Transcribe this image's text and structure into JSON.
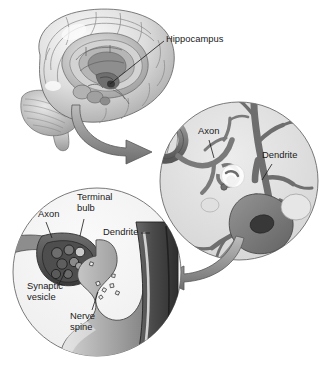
{
  "figure": {
    "background_color": "#ffffff"
  },
  "palette": {
    "ink": "#1a1a1a",
    "circle_fill_light": "#e3e3e3",
    "circle_fill_lighter": "#f2f2f2",
    "neuron_mid_gray": "#8d8d8d",
    "neuron_dark_gray": "#6f6f6f",
    "soma_gray": "#7d7d7d",
    "nucleus_dark": "#3f3f3f",
    "arrow_gray": "#9a9a9a",
    "arrow_dark_edge": "#5c5c5c",
    "brain_light": "#efefef",
    "brain_mid": "#c9c9c9",
    "brain_shadow": "#8f8f8f",
    "outline": "#555555",
    "terminal_dark": "#4a4a4a",
    "dendrite_dark": "#444444",
    "white": "#ffffff"
  },
  "panels": {
    "brain": {
      "name": "brain-illustration",
      "labels": [
        {
          "id": "hippocampus",
          "text": "Hippocampus",
          "x": 166,
          "y": 40
        }
      ]
    },
    "neuron_circle": {
      "name": "neuron-closeup-circle",
      "center_x": 239,
      "center_y": 181,
      "radius": 79,
      "labels": [
        {
          "id": "axon",
          "text": "Axon",
          "x": 198,
          "y": 132
        },
        {
          "id": "dendrite",
          "text": "Dendrite",
          "x": 262,
          "y": 156
        }
      ]
    },
    "synapse_circle": {
      "name": "synapse-closeup-circle",
      "center_x": 97,
      "center_y": 272,
      "radius": 84,
      "labels": [
        {
          "id": "axon",
          "text": "Axon",
          "x": 38,
          "y": 215
        },
        {
          "id": "terminal_bulb",
          "line1": "Terminal",
          "line2": "bulb",
          "x": 77,
          "y": 203
        },
        {
          "id": "dendrite",
          "text": "Dendrite",
          "x": 103,
          "y": 233
        },
        {
          "id": "synaptic_vesicle",
          "line1": "Synaptic",
          "line2": "vesicle",
          "x": 27,
          "y": 291
        },
        {
          "id": "nerve_spine",
          "line1": "Nerve",
          "line2": "spine",
          "x": 70,
          "y": 318
        }
      ]
    },
    "arrows": [
      {
        "id": "brain-to-neuron",
        "direction": "right"
      },
      {
        "id": "neuron-to-synapse",
        "direction": "left"
      }
    ]
  }
}
